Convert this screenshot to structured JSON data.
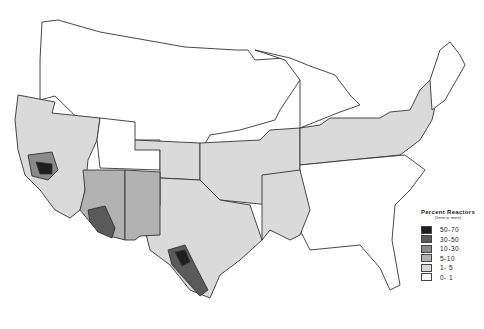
{
  "legend": {
    "title": "Percent Reactors",
    "subtitle": "(5mm or more)",
    "items": [
      {
        "label": "50-70",
        "color": "#1e1e1e"
      },
      {
        "label": "30-50",
        "color": "#5a5a5a"
      },
      {
        "label": "10-30",
        "color": "#8a8a8a"
      },
      {
        "label": "5-10",
        "color": "#b2b2b2"
      },
      {
        "label": "1- 5",
        "color": "#dadada"
      },
      {
        "label": "0- 1",
        "color": "#ffffff"
      }
    ]
  },
  "map": {
    "subject": "United States choropleth of percent reactors by county/region",
    "fill_colors": {
      "c50_70": "#1e1e1e",
      "c30_50": "#5a5a5a",
      "c10_30": "#8a8a8a",
      "c5_10": "#b2b2b2",
      "c1_5": "#dadada",
      "c0_1": "#ffffff"
    }
  }
}
